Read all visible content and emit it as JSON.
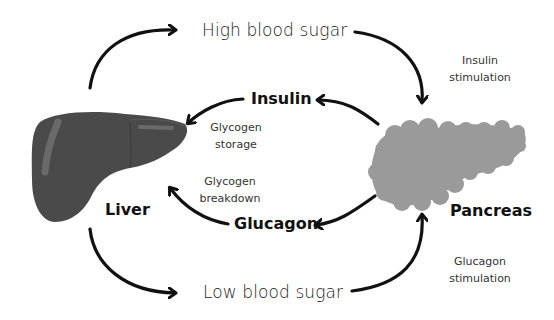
{
  "diagram": {
    "organs": {
      "liver": {
        "label": "Liver",
        "color": "#4a4a4a",
        "highlight": "#6a6a6a"
      },
      "pancreas": {
        "label": "Pancreas",
        "color": "#9a9a9a"
      }
    },
    "states": {
      "high": "High blood sugar",
      "low": "Low blood sugar"
    },
    "hormones": {
      "insulin": "Insulin",
      "glucagon": "Glucagon"
    },
    "processes": {
      "insulin_stimulation": [
        "Insulin",
        "stimulation"
      ],
      "glucagon_stimulation": [
        "Glucagon",
        "stimulation"
      ],
      "glycogen_storage": [
        "Glycogen",
        "storage"
      ],
      "glycogen_breakdown": [
        "Glycogen",
        "breakdown"
      ]
    },
    "arrow_color": "#111111"
  }
}
